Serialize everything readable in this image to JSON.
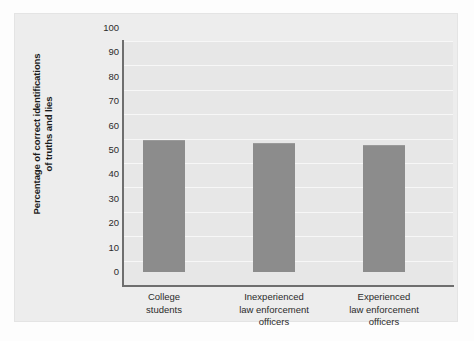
{
  "chart_data": {
    "type": "bar",
    "title": "",
    "subtitle": "",
    "xlabel": "",
    "ylabel": "Percentage of correct identifications of truths and lies",
    "ylabel_lines": [
      "Percentage of correct identifications",
      "of truths and lies"
    ],
    "categories": [
      "College students",
      "Inexperienced law enforcement officers",
      "Experienced law enforcement officers"
    ],
    "category_lines": [
      [
        "College",
        "students"
      ],
      [
        "Inexperienced",
        "law enforcement",
        "officers"
      ],
      [
        "Experienced",
        "law enforcement",
        "officers"
      ]
    ],
    "values": [
      54,
      53,
      52
    ],
    "ylim": [
      0,
      100
    ],
    "ytick_step": 10,
    "yticks": [
      100,
      90,
      80,
      70,
      60,
      50,
      40,
      30,
      20,
      10,
      0
    ],
    "ytick_labels": [
      "100",
      "90",
      "80",
      "70",
      "60",
      "50",
      "40",
      "30",
      "20",
      "10",
      "0"
    ],
    "grid": "horizontal",
    "legend": "none",
    "colors": {
      "bar_fill": "#8c8c8c",
      "plot_background": "#e7e7e7",
      "panel_background": "#ededed",
      "gridline": "#f7f7f7",
      "axis_line": "#6e6e6e",
      "text": "#2b2b2b"
    }
  }
}
